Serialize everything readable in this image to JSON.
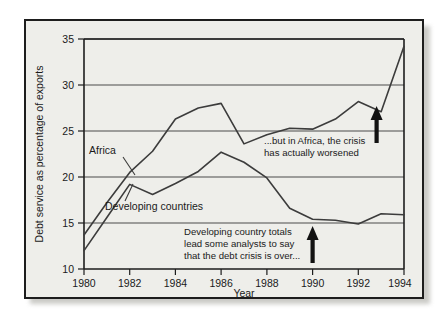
{
  "chart_data": {
    "type": "line",
    "title": "",
    "xlabel": "Year",
    "ylabel": "Debt service as percentage of exports",
    "xlim": [
      1980,
      1994
    ],
    "ylim": [
      10,
      35
    ],
    "grid": true,
    "legend_position": "inline-labels",
    "x": [
      1980,
      1981,
      1982,
      1983,
      1984,
      1985,
      1986,
      1987,
      1988,
      1989,
      1990,
      1991,
      1992,
      1993,
      1994
    ],
    "xticks": [
      "1980",
      "1982",
      "1984",
      "1986",
      "1988",
      "1990",
      "1992",
      "1994"
    ],
    "yticks": [
      "10",
      "15",
      "20",
      "25",
      "30",
      "35"
    ],
    "series": [
      {
        "name": "Africa",
        "values": [
          13.7,
          17.2,
          20.5,
          22.8,
          26.3,
          27.5,
          28.0,
          23.6,
          24.6,
          25.3,
          25.2,
          26.3,
          28.2,
          27.1,
          34.2
        ]
      },
      {
        "name": "Developing countries",
        "values": [
          12.0,
          15.6,
          19.2,
          18.1,
          19.3,
          20.6,
          22.7,
          21.6,
          19.9,
          16.6,
          15.4,
          15.3,
          14.9,
          16.0,
          15.9
        ]
      }
    ],
    "annotations": [
      {
        "id": "africa-annotation",
        "lines": [
          "...but in Africa, the crisis",
          "has actually worsened"
        ],
        "arrow": "up",
        "arrow_x": 1993,
        "arrow_y_from": 24.6,
        "arrow_y_to": 27.0
      },
      {
        "id": "developing-annotation",
        "lines": [
          "Developing country totals",
          "lead some analysts to say",
          "that the debt crisis is over..."
        ],
        "arrow": "up",
        "arrow_x": 1991,
        "arrow_y_from": 11.0,
        "arrow_y_to": 14.6
      }
    ]
  },
  "colors": {
    "panel_background": "#eeeeea",
    "panel_border": "#1d1d1d",
    "line": "#3c3c3c",
    "grid": "#4a4a4a",
    "text": "#1a1a1a",
    "page_background": "#ffffff"
  }
}
